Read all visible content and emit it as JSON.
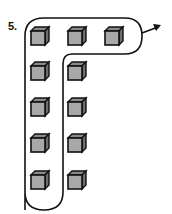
{
  "problem": {
    "number_label": "5."
  },
  "diagram": {
    "cube_color": "#a8a8a8",
    "cube_dark": "#6e6e6e",
    "cube_top": "#8a8a8a",
    "outline_color": "#111111",
    "cubes": [
      {
        "row": 0,
        "col": 0,
        "x": 31,
        "y": 27
      },
      {
        "row": 0,
        "col": 1,
        "x": 68,
        "y": 27
      },
      {
        "row": 0,
        "col": 2,
        "x": 105,
        "y": 27
      },
      {
        "row": 1,
        "col": 0,
        "x": 31,
        "y": 62
      },
      {
        "row": 1,
        "col": 1,
        "x": 68,
        "y": 62
      },
      {
        "row": 2,
        "col": 0,
        "x": 31,
        "y": 98
      },
      {
        "row": 2,
        "col": 1,
        "x": 68,
        "y": 98
      },
      {
        "row": 3,
        "col": 0,
        "x": 31,
        "y": 134
      },
      {
        "row": 3,
        "col": 1,
        "x": 68,
        "y": 134
      },
      {
        "row": 4,
        "col": 0,
        "x": 31,
        "y": 171
      },
      {
        "row": 4,
        "col": 1,
        "x": 68,
        "y": 171
      }
    ],
    "arrow": {
      "direction": "right-up"
    }
  }
}
